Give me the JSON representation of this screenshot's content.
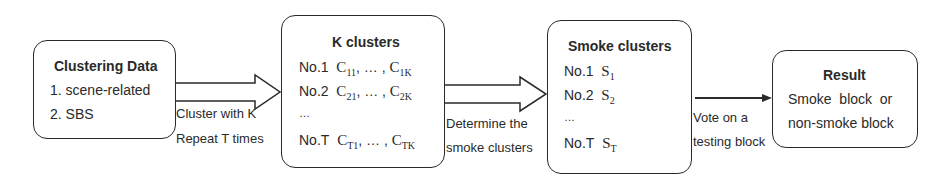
{
  "diagram": {
    "boxes": [
      {
        "id": "clustering-data",
        "title": "Clustering Data",
        "lines": [
          "1. scene-related",
          "2. SBS"
        ]
      },
      {
        "id": "k-clusters",
        "title": "K clusters",
        "rows": [
          {
            "label": "No.1",
            "first": "C",
            "first_sub": "11",
            "sep": ", … , ",
            "last": "C",
            "last_sub": "1K"
          },
          {
            "label": "No.2",
            "first": "C",
            "first_sub": "21",
            "sep": ", … , ",
            "last": "C",
            "last_sub": "2K"
          },
          {
            "label": "…"
          },
          {
            "label": "No.T",
            "first": "C",
            "first_sub": "T1",
            "sep": ", … , ",
            "last": "C",
            "last_sub": "TK"
          }
        ]
      },
      {
        "id": "smoke-clusters",
        "title": "Smoke clusters",
        "rows": [
          {
            "label": "No.1",
            "sym": "S",
            "sub": "1"
          },
          {
            "label": "No.2",
            "sym": "S",
            "sub": "2"
          },
          {
            "label": "…"
          },
          {
            "label": "No.T",
            "sym": "S",
            "sub": "T"
          }
        ]
      },
      {
        "id": "result",
        "title": "Result",
        "lines": [
          "Smoke  block  or",
          "non-smoke block"
        ]
      }
    ],
    "arrows": [
      {
        "from": "clustering-data",
        "to": "k-clusters",
        "style": "block",
        "labels": [
          "Cluster with K",
          "Repeat T times"
        ]
      },
      {
        "from": "k-clusters",
        "to": "smoke-clusters",
        "style": "block",
        "labels": [
          "Determine the",
          "smoke clusters"
        ]
      },
      {
        "from": "smoke-clusters",
        "to": "result",
        "style": "line",
        "labels": [
          "Vote on a",
          "testing block"
        ]
      }
    ],
    "colors": {
      "stroke": "#2a2a2a",
      "background": "#ffffff"
    }
  }
}
